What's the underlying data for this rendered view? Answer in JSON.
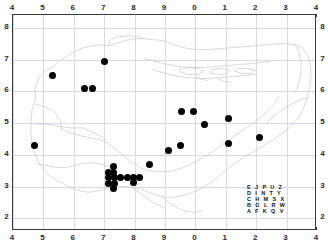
{
  "map": {
    "title": "Distribution dot map",
    "axes": {
      "top_ticks": [
        "4",
        "5",
        "6",
        "7",
        "8",
        "9",
        "0",
        "1",
        "2",
        "3",
        "4"
      ],
      "bottom_ticks": [
        "4",
        "5",
        "6",
        "7",
        "8",
        "9",
        "0",
        "1",
        "2",
        "3",
        "4"
      ],
      "left_ticks": [
        "8",
        "7",
        "6",
        "5",
        "4",
        "3",
        "2"
      ],
      "right_ticks": [
        "8",
        "7",
        "6",
        "5",
        "4",
        "3",
        "2"
      ]
    },
    "grid_letter_key": {
      "rows": [
        "E J P U Z",
        "D I N T Y",
        "C H M S X",
        "B G L R W",
        "A F K Q V"
      ]
    },
    "colors": {
      "dot": "#000000",
      "gridline": "#d9d9e2",
      "coastline": "#c9c9cf",
      "frame": "#3a3a3a",
      "background": "#ffffff",
      "label": "#2b2b2b"
    },
    "dot_symbol": "filled-circle",
    "dot_count": 27
  },
  "chart_data": {
    "type": "scatter",
    "xlabel": "",
    "ylabel": "",
    "grid": true,
    "legend": "none",
    "xticklabels": [
      "4",
      "5",
      "6",
      "7",
      "8",
      "9",
      "0",
      "1",
      "2",
      "3",
      "4"
    ],
    "yticklabels": [
      "8",
      "7",
      "6",
      "5",
      "4",
      "3",
      "2"
    ],
    "xlim": [
      4,
      14
    ],
    "ylim": [
      1.6,
      8.4
    ],
    "note": "x tick labels wrap 4..9 then 0..4; y tick labels run 8 (top) down to 2 (bottom)",
    "points": [
      {
        "x": 5.3,
        "y": 6.5
      },
      {
        "x": 6.35,
        "y": 6.1
      },
      {
        "x": 6.6,
        "y": 6.1
      },
      {
        "x": 7.0,
        "y": 6.95
      },
      {
        "x": 4.7,
        "y": 4.3
      },
      {
        "x": 9.55,
        "y": 5.35
      },
      {
        "x": 9.95,
        "y": 5.35
      },
      {
        "x": 11.1,
        "y": 5.15
      },
      {
        "x": 10.3,
        "y": 4.95
      },
      {
        "x": 12.1,
        "y": 4.55
      },
      {
        "x": 9.5,
        "y": 4.3
      },
      {
        "x": 11.1,
        "y": 4.35
      },
      {
        "x": 9.1,
        "y": 4.15
      },
      {
        "x": 8.5,
        "y": 3.7
      },
      {
        "x": 7.3,
        "y": 3.45
      },
      {
        "x": 7.15,
        "y": 3.3
      },
      {
        "x": 7.35,
        "y": 3.3
      },
      {
        "x": 7.75,
        "y": 3.3
      },
      {
        "x": 7.95,
        "y": 3.3
      },
      {
        "x": 8.15,
        "y": 3.3
      },
      {
        "x": 7.15,
        "y": 3.1
      },
      {
        "x": 7.35,
        "y": 3.1
      },
      {
        "x": 7.95,
        "y": 3.12
      },
      {
        "x": 7.3,
        "y": 2.93
      },
      {
        "x": 7.3,
        "y": 3.62
      },
      {
        "x": 7.55,
        "y": 3.3
      },
      {
        "x": 7.15,
        "y": 3.45
      }
    ]
  }
}
